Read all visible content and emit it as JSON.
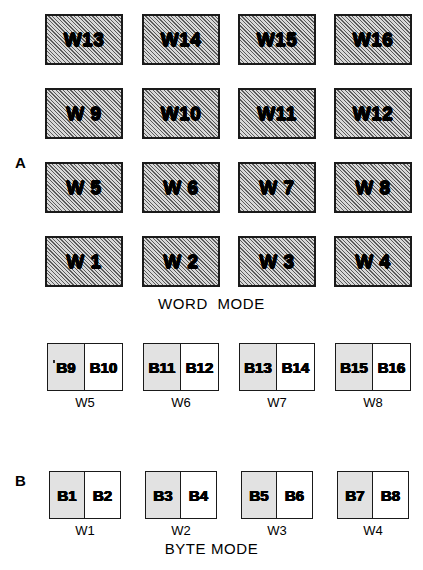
{
  "figure": {
    "panels": [
      {
        "letter": "A",
        "mode_title": "WORD  MODE"
      },
      {
        "letter": "B",
        "mode_title": "BYTE MODE"
      }
    ]
  },
  "word_mode": {
    "title": "WORD  MODE",
    "panel_letter": "A",
    "rows": [
      {
        "cells": [
          "W13",
          "W14",
          "W15",
          "W16"
        ]
      },
      {
        "cells": [
          "W 9",
          "W10",
          "W11",
          "W12"
        ]
      },
      {
        "cells": [
          "W 5",
          "W 6",
          "W 7",
          "W 8"
        ]
      },
      {
        "cells": [
          "W 1",
          "W 2",
          "W 3",
          "W 4"
        ]
      }
    ]
  },
  "byte_mode": {
    "title": "BYTE MODE",
    "panel_letter": "B",
    "rows": [
      {
        "words": [
          {
            "caption": "W5",
            "high_byte": "B9",
            "low_byte": "B10"
          },
          {
            "caption": "W6",
            "high_byte": "B11",
            "low_byte": "B12"
          },
          {
            "caption": "W7",
            "high_byte": "B13",
            "low_byte": "B14"
          },
          {
            "caption": "W8",
            "high_byte": "B15",
            "low_byte": "B16"
          }
        ]
      },
      {
        "words": [
          {
            "caption": "W1",
            "high_byte": "B1",
            "low_byte": "B2"
          },
          {
            "caption": "W2",
            "high_byte": "B3",
            "low_byte": "B4"
          },
          {
            "caption": "W3",
            "high_byte": "B5",
            "low_byte": "B6"
          },
          {
            "caption": "W4",
            "high_byte": "B7",
            "low_byte": "B8"
          }
        ]
      }
    ]
  },
  "style": {
    "ink": "#000000",
    "page_background": "#ffffff",
    "word_fill": "#d8d8d8",
    "byte_shaded_fill": "#e2e2e2",
    "byte_plain_fill": "#ffffff"
  }
}
